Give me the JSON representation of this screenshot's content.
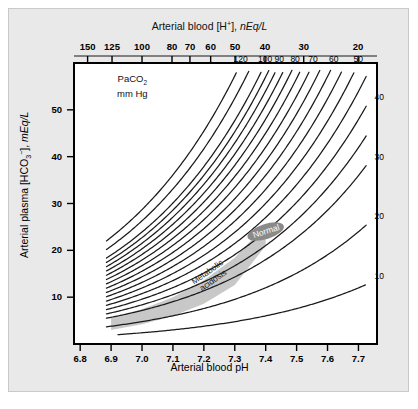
{
  "figure": {
    "top_axis_title_html": "Arterial blood [H<sup>+</sup>], <i>nEq/L</i>",
    "top_axis_title_text": "Arterial blood [H+], nEq/L",
    "bottom_axis_title": "Arterial blood pH",
    "left_axis_title_text": "Arterial plasma [HCO3-], mEq/L",
    "left_axis_title_html": "Arterial plasma [HCO<sub>3</sub><sup>&minus;</sup>], <i>mEq/L</i>",
    "curve_family_label_line1": "PaCO",
    "curve_family_label_sub": "2",
    "curve_family_label_line2": "mm Hg",
    "region_normal_label": "Normal",
    "region_acidosis_label_line1": "Metabolic",
    "region_acidosis_label_line2": "acidosis"
  },
  "colors": {
    "panel_background": "#e9e9e9",
    "plot_background": "#ffffff",
    "frame": "#000000",
    "curve": "#1a1a1a",
    "band_fill": "#c8c8c8",
    "normal_ellipse": "#8a8a8a",
    "normal_text": "#ffffff",
    "text": "#000000"
  },
  "chart_data": {
    "type": "line",
    "title": "",
    "xlabel": "Arterial blood pH",
    "ylabel": "Arterial plasma [HCO3-], mEq/L",
    "xlim": [
      6.78,
      7.76
    ],
    "ylim": [
      0,
      60
    ],
    "grid": false,
    "legend": "inline-curve-labels",
    "x_ticks": [
      "6.8",
      "6.9",
      "7.0",
      "7.1",
      "7.2",
      "7.3",
      "7.4",
      "7.5",
      "7.6",
      "7.7"
    ],
    "x_tick_values": [
      6.8,
      6.9,
      7.0,
      7.1,
      7.2,
      7.3,
      7.4,
      7.5,
      7.6,
      7.7
    ],
    "y_ticks": [
      "10",
      "20",
      "30",
      "40",
      "50"
    ],
    "y_tick_values": [
      10,
      20,
      30,
      40,
      50
    ],
    "top_axis": {
      "label": "Arterial blood [H+], nEq/L",
      "ticks": [
        "150",
        "125",
        "100",
        "80",
        "70",
        "60",
        "50",
        "40",
        "30",
        "20"
      ],
      "tick_values": [
        150,
        125,
        100,
        80,
        70,
        60,
        50,
        40,
        30,
        20
      ],
      "tick_ph_positions": [
        6.824,
        6.903,
        7.0,
        7.097,
        7.155,
        7.222,
        7.301,
        7.398,
        7.523,
        7.699
      ]
    },
    "series_label_units": "mm Hg",
    "series_label_name": "PaCO2",
    "equation": "HCO3 = 0.0301 * PaCO2 * 10^(pH - 6.1)",
    "series": [
      {
        "name": "120",
        "paco2": 120,
        "label_side": "top"
      },
      {
        "name": "100",
        "paco2": 100,
        "label_side": "top"
      },
      {
        "name": "90",
        "paco2": 90,
        "label_side": "top"
      },
      {
        "name": "80",
        "paco2": 80,
        "label_side": "top"
      },
      {
        "name": "70",
        "paco2": 70,
        "label_side": "top"
      },
      {
        "name": "60",
        "paco2": 60,
        "label_side": "top"
      },
      {
        "name": "50",
        "paco2": 50,
        "label_side": "top"
      },
      {
        "name": "40",
        "paco2": 40,
        "label_side": "right"
      },
      {
        "name": "30",
        "paco2": 30,
        "label_side": "right"
      },
      {
        "name": "20",
        "paco2": 20,
        "label_side": "right"
      },
      {
        "name": "10",
        "paco2": 10,
        "label_side": "right"
      }
    ],
    "unlabeled_series_paco2": [
      110,
      95,
      85,
      75,
      65,
      55,
      45,
      35
    ],
    "annotations": [
      {
        "name": "normal",
        "text": "Normal",
        "ph": 7.4,
        "hco3": 24
      },
      {
        "name": "metabolic-acidosis",
        "text": "Metabolic acidosis",
        "ph": 7.22,
        "hco3": 14,
        "rotation_deg": -35
      }
    ],
    "band": {
      "name": "metabolic-acidosis-band",
      "description": "Shaded band running from low pH / low HCO3 up to the Normal point",
      "points_ph": [
        6.9,
        7.0,
        7.1,
        7.2,
        7.3,
        7.4
      ],
      "points_hco3_upper": [
        5.6,
        7.4,
        10.0,
        13.6,
        18.4,
        25.5
      ],
      "points_hco3_lower": [
        3.0,
        4.2,
        6.0,
        8.6,
        12.6,
        21.0
      ]
    }
  }
}
